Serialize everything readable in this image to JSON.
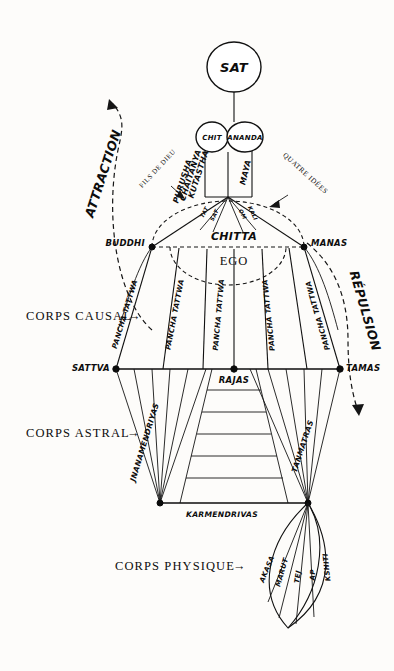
{
  "title_node": {
    "sat": "SAT"
  },
  "second_row": {
    "chit": "CHIT",
    "ananda": "ANANDA"
  },
  "vertical_left_labels": {
    "kutastha": "KUTASTHA",
    "chaitanya": "CHAITANYA",
    "purusha": "PURUSHA"
  },
  "vertical_right_labels": {
    "maya": "MAYA"
  },
  "four_ideas": {
    "annotation": "QUATRE IDÉES",
    "items": [
      "TAT",
      "SAT",
      "OM",
      "KALI"
    ]
  },
  "son_of_god": {
    "annotation": "FILS DE DIEU"
  },
  "forces": {
    "attraction": "ATTRACTION",
    "repulsion": "RÉPULSION"
  },
  "mind_row": {
    "left": "BUDDHI",
    "center_top": "CHITTA",
    "center_bottom": "EGO",
    "right": "MANAS"
  },
  "bodies": {
    "causal": "CORPS CAUSAL",
    "astral": "CORPS ASTRAL",
    "physical": "CORPS PHYSIQUE",
    "arrow": "→"
  },
  "pancha_tattwa": {
    "label": "PANCHA TATTWA",
    "columns": [
      "PANCHA TATTWA",
      "PANCHA TATTWA",
      "PANCHA TATTWA",
      "PANCHA TATTWA",
      "PANCHA TATTWA"
    ]
  },
  "gunas": {
    "left": "SATTVA",
    "center": "RAJAS",
    "right": "TAMAS"
  },
  "astral_organs": {
    "left": "JNANAMENDRIYAS",
    "right": "TANMATRAS",
    "bottom": "KARMENDRIVAS"
  },
  "physical_elements": {
    "items": [
      "AKASA",
      "MARUT",
      "TEJ",
      "AP",
      "KSHITI"
    ]
  },
  "colors": {
    "ink": "#0d0d0d",
    "paper": "#fdfcfa"
  }
}
